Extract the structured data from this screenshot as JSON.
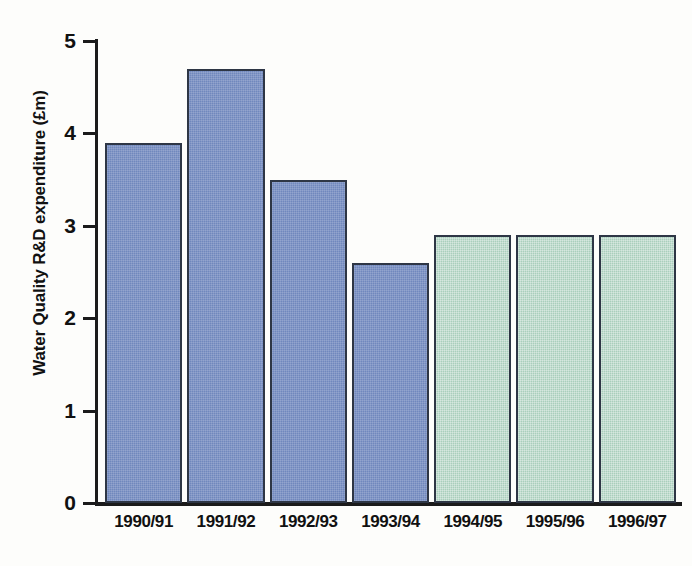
{
  "chart_data": {
    "type": "bar",
    "title": "",
    "subtitle": "",
    "xlabel": "",
    "ylabel": "Water Quality R&D expenditure (£m)",
    "categories": [
      "1990/91",
      "1991/92",
      "1992/93",
      "1993/94",
      "1994/95",
      "1995/96",
      "1996/97"
    ],
    "values": [
      3.9,
      4.7,
      3.5,
      2.6,
      2.9,
      2.9,
      2.9
    ],
    "bar_colors": [
      "#7088bd",
      "#7088bd",
      "#7088bd",
      "#7088bd",
      "#a9cfbc",
      "#a9cfbc",
      "#a9cfbc"
    ],
    "bar_color_groups": [
      {
        "name": "actual",
        "color": "#7088bd",
        "categories": [
          "1990/91",
          "1991/92",
          "1992/93",
          "1993/94"
        ]
      },
      {
        "name": "projected",
        "color": "#a9cfbc",
        "categories": [
          "1994/95",
          "1995/96",
          "1996/97"
        ]
      }
    ],
    "ylim": [
      0,
      5
    ],
    "yticks": [
      0,
      1,
      2,
      3,
      4,
      5
    ],
    "ytick_labels": [
      "0",
      "1",
      "2",
      "3",
      "4",
      "5"
    ],
    "grid": false,
    "legend": false,
    "legend_position": "none",
    "bar_outline_color": "#2e3645",
    "background_color": "#fdfdfb",
    "axis_color": "#1b1b1b",
    "text_color": "#111111"
  }
}
